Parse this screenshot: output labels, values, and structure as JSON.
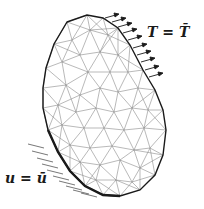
{
  "diagram": {
    "type": "fem-mesh-boundary-conditions",
    "labels": {
      "traction": "T = T̄",
      "displacement": "u = ū"
    },
    "colors": {
      "background": "#ffffff",
      "mesh_line": "#8a8a8a",
      "boundary": "#1a1a1a",
      "arrow": "#1a1a1a",
      "hatch": "#555555"
    },
    "boundary": [
      [
        67,
        22
      ],
      [
        87,
        15
      ],
      [
        103,
        18
      ],
      [
        118,
        28
      ],
      [
        130,
        45
      ],
      [
        143,
        70
      ],
      [
        155,
        90
      ],
      [
        163,
        110
      ],
      [
        166,
        130
      ],
      [
        163,
        155
      ],
      [
        155,
        175
      ],
      [
        140,
        190
      ],
      [
        120,
        196
      ],
      [
        103,
        195
      ],
      [
        85,
        186
      ],
      [
        70,
        171
      ],
      [
        58,
        152
      ],
      [
        48,
        130
      ],
      [
        43,
        108
      ],
      [
        43,
        88
      ],
      [
        46,
        68
      ],
      [
        54,
        44
      ]
    ],
    "interior_nodes": [
      [
        72,
        40
      ],
      [
        90,
        30
      ],
      [
        108,
        35
      ],
      [
        80,
        55
      ],
      [
        100,
        52
      ],
      [
        118,
        55
      ],
      [
        62,
        62
      ],
      [
        88,
        72
      ],
      [
        110,
        72
      ],
      [
        128,
        72
      ],
      [
        66,
        85
      ],
      [
        80,
        95
      ],
      [
        100,
        88
      ],
      [
        118,
        92
      ],
      [
        138,
        88
      ],
      [
        58,
        105
      ],
      [
        76,
        112
      ],
      [
        96,
        108
      ],
      [
        114,
        112
      ],
      [
        132,
        108
      ],
      [
        148,
        110
      ],
      [
        62,
        125
      ],
      [
        84,
        128
      ],
      [
        104,
        128
      ],
      [
        124,
        130
      ],
      [
        144,
        128
      ],
      [
        70,
        145
      ],
      [
        90,
        148
      ],
      [
        112,
        146
      ],
      [
        134,
        150
      ],
      [
        150,
        148
      ],
      [
        80,
        162
      ],
      [
        100,
        165
      ],
      [
        120,
        160
      ],
      [
        140,
        168
      ],
      [
        96,
        180
      ],
      [
        116,
        180
      ],
      [
        132,
        182
      ]
    ],
    "traction_arrows": [
      [
        105,
        18
      ],
      [
        112,
        22
      ],
      [
        118,
        27
      ],
      [
        123,
        33
      ],
      [
        128,
        40
      ],
      [
        133,
        48
      ],
      [
        137,
        55
      ],
      [
        141,
        62
      ],
      [
        145,
        70
      ],
      [
        149,
        77
      ]
    ],
    "hatch_points": [
      [
        44,
        148
      ],
      [
        48,
        155
      ],
      [
        53,
        162
      ],
      [
        58,
        168
      ],
      [
        63,
        174
      ],
      [
        69,
        180
      ],
      [
        75,
        185
      ],
      [
        82,
        190
      ],
      [
        89,
        194
      ],
      [
        97,
        197
      ]
    ]
  }
}
